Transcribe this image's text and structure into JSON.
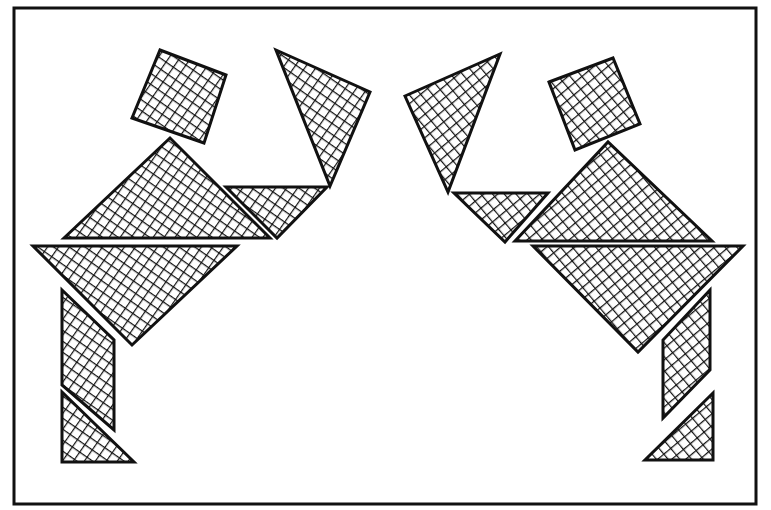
{
  "figure": {
    "title": "",
    "colors": {
      "background": "#ffffff",
      "ink": "#111111",
      "frame": "#111111"
    },
    "frame": {
      "x": 14,
      "y": 8,
      "width": 742,
      "height": 496
    },
    "figures": [
      {
        "name": "left-figure",
        "pieces": [
          {
            "name": "head-square",
            "points": "160,50 226,75 204,143 132,118"
          },
          {
            "name": "arm-triangle",
            "points": "276,50 370,92 330,186"
          },
          {
            "name": "torso-large-triangle",
            "points": "64,238 170,138 270,238"
          },
          {
            "name": "hand-small-triangle",
            "points": "226,187 327,187 277,238"
          },
          {
            "name": "hip-large-triangle",
            "points": "33,246 237,246 132,345"
          },
          {
            "name": "leg-parallelogram",
            "points": "62,290 114,340 114,430 62,385"
          },
          {
            "name": "foot-small-triangle",
            "points": "62,392 134,462 62,462"
          }
        ]
      },
      {
        "name": "right-figure",
        "pieces": [
          {
            "name": "head-square",
            "points": "549,82 613,58 640,124 575,150"
          },
          {
            "name": "arm-triangle",
            "points": "405,96 500,54 448,192"
          },
          {
            "name": "torso-large-triangle",
            "points": "515,241 608,142 712,241"
          },
          {
            "name": "hand-small-triangle",
            "points": "454,193 548,193 505,242"
          },
          {
            "name": "hip-large-triangle",
            "points": "533,246 743,246 638,352"
          },
          {
            "name": "leg-parallelogram",
            "points": "710,290 710,370 663,418 663,340"
          },
          {
            "name": "foot-small-triangle",
            "points": "713,393 713,460 645,460"
          }
        ]
      }
    ]
  }
}
